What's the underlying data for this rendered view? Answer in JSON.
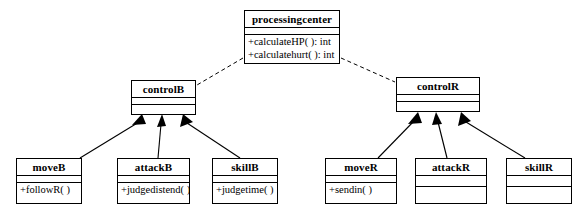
{
  "diagram": {
    "type": "uml-class-diagram",
    "title": "",
    "background_color": "#ffffff",
    "line_color": "#000000"
  },
  "classes": [
    {
      "id": "processingcenter",
      "name": "processingcenter",
      "attributes": [],
      "operations": [
        "+calculateHP( ): int",
        "+calculatehurt( ): int"
      ],
      "x": 244,
      "y": 10,
      "width": 96,
      "height": 54,
      "empty_compartments": 1
    },
    {
      "id": "controlB",
      "name": "controlB",
      "attributes": [],
      "operations": [],
      "x": 131,
      "y": 80,
      "width": 65,
      "height": 35,
      "empty_compartments": 2
    },
    {
      "id": "controlR",
      "name": "controlR",
      "attributes": [],
      "operations": [],
      "x": 396,
      "y": 77,
      "width": 84,
      "height": 35,
      "empty_compartments": 2
    },
    {
      "id": "moveB",
      "name": "moveB",
      "attributes": [],
      "operations": [
        "+followR( )"
      ],
      "x": 16,
      "y": 158,
      "width": 66,
      "height": 46,
      "empty_compartments": 1
    },
    {
      "id": "attackB",
      "name": "attackB",
      "attributes": [],
      "operations": [
        "+judgedistend( )"
      ],
      "x": 117,
      "y": 158,
      "width": 73,
      "height": 46,
      "empty_compartments": 1
    },
    {
      "id": "skillB",
      "name": "skillB",
      "attributes": [],
      "operations": [
        "+judgetime( )"
      ],
      "x": 212,
      "y": 158,
      "width": 66,
      "height": 46,
      "empty_compartments": 1
    },
    {
      "id": "moveR",
      "name": "moveR",
      "attributes": [],
      "operations": [
        "+sendin( )"
      ],
      "x": 325,
      "y": 158,
      "width": 72,
      "height": 46,
      "empty_compartments": 1
    },
    {
      "id": "attackR",
      "name": "attackR",
      "attributes": [],
      "operations": [],
      "x": 415,
      "y": 158,
      "width": 72,
      "height": 46,
      "empty_compartments": 2
    },
    {
      "id": "skillR",
      "name": "skillR",
      "attributes": [],
      "operations": [],
      "x": 506,
      "y": 158,
      "width": 66,
      "height": 46,
      "empty_compartments": 2
    }
  ],
  "relationships": [
    {
      "id": "dep-pc-controlB",
      "type": "dependency",
      "style": "dashed",
      "from": "processingcenter",
      "to": "controlB",
      "arrowhead": "none"
    },
    {
      "id": "dep-pc-controlR",
      "type": "dependency",
      "style": "dashed",
      "from": "processingcenter",
      "to": "controlR",
      "arrowhead": "none"
    },
    {
      "id": "gen-moveB-controlB",
      "type": "generalization",
      "style": "solid",
      "from": "moveB",
      "to": "controlB",
      "arrowhead": "filled-triangle"
    },
    {
      "id": "gen-attackB-controlB",
      "type": "generalization",
      "style": "solid",
      "from": "attackB",
      "to": "controlB",
      "arrowhead": "filled-triangle"
    },
    {
      "id": "gen-skillB-controlB",
      "type": "generalization",
      "style": "solid",
      "from": "skillB",
      "to": "controlB",
      "arrowhead": "filled-triangle"
    },
    {
      "id": "gen-moveR-controlR",
      "type": "generalization",
      "style": "solid",
      "from": "moveR",
      "to": "controlR",
      "arrowhead": "filled-triangle"
    },
    {
      "id": "gen-attackR-controlR",
      "type": "generalization",
      "style": "solid",
      "from": "attackR",
      "to": "controlR",
      "arrowhead": "filled-triangle"
    },
    {
      "id": "gen-skillR-controlR",
      "type": "generalization",
      "style": "solid",
      "from": "skillR",
      "to": "controlR",
      "arrowhead": "filled-triangle"
    }
  ]
}
